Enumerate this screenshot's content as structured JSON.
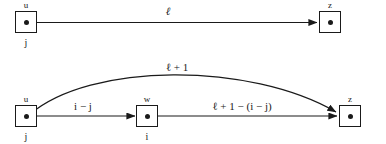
{
  "figure": {
    "stroke_color": "#1a1a1a",
    "background_color": "#ffffff"
  },
  "diagrams": [
    {
      "id": "top-diagram",
      "nodes": [
        {
          "id": "top-u",
          "name": "u",
          "index": "j"
        },
        {
          "id": "top-z",
          "name": "z",
          "index": ""
        }
      ],
      "edges": [
        {
          "id": "top-u-to-z",
          "from": "u",
          "to": "z",
          "weight": "ℓ",
          "style": "straight"
        }
      ]
    },
    {
      "id": "bottom-diagram",
      "nodes": [
        {
          "id": "bot-u",
          "name": "u",
          "index": "j"
        },
        {
          "id": "bot-w",
          "name": "w",
          "index": "i"
        },
        {
          "id": "bot-z",
          "name": "z",
          "index": ""
        }
      ],
      "edges": [
        {
          "id": "bot-u-to-w",
          "from": "u",
          "to": "w",
          "weight": "i − j",
          "style": "straight"
        },
        {
          "id": "bot-w-to-z",
          "from": "w",
          "to": "z",
          "weight": "ℓ + 1 − (i − j)",
          "style": "straight"
        },
        {
          "id": "bot-u-to-z-arc",
          "from": "u",
          "to": "z",
          "weight": "ℓ + 1",
          "style": "curved"
        }
      ]
    }
  ]
}
